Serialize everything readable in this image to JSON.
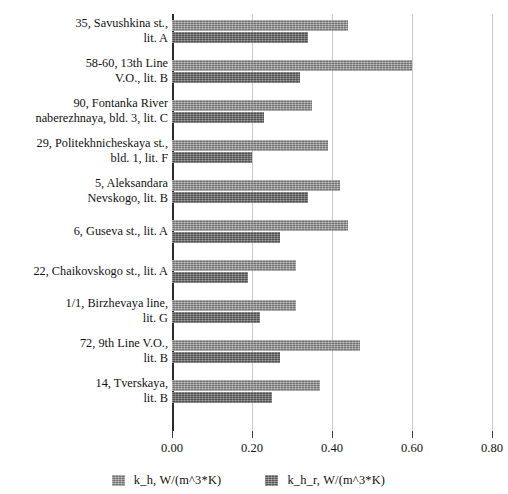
{
  "chart_data": {
    "type": "bar",
    "orientation": "horizontal",
    "title": "",
    "xlabel": "",
    "ylabel": "",
    "xlim": [
      0.0,
      0.8
    ],
    "grid": true,
    "legend_position": "bottom",
    "tick_labels": [
      "0.00",
      "0.20",
      "0.40",
      "0.60",
      "0.80"
    ],
    "tick_values": [
      0.0,
      0.2,
      0.4,
      0.6,
      0.8
    ],
    "categories": [
      "35, Savushkina st.,\nlit. A",
      "58-60, 13th Line\nV.O., lit. B",
      "90, Fontanka River\nnaberezhnaya, bld. 3, lit. C",
      "29, Politekhnicheskaya st.,\nbld. 1, lit. F",
      "5, Aleksandara\nNevskogo, lit. B",
      "6, Guseva st., lit. A",
      "22, Chaikovskogo st., lit. A",
      "1/1, Birzhevaya line,\nlit. G",
      "72, 9th Line V.O.,\nlit. B",
      "14, Tverskaya,\nlit. B"
    ],
    "series": [
      {
        "name": "k_h, W/(m^3*K)",
        "color": "#8f8f8f",
        "values": [
          0.44,
          0.6,
          0.35,
          0.39,
          0.42,
          0.44,
          0.31,
          0.31,
          0.47,
          0.37
        ]
      },
      {
        "name": "k_h_r, W/(m^3*K)",
        "color": "#6b6b6b",
        "values": [
          0.34,
          0.32,
          0.23,
          0.2,
          0.34,
          0.27,
          0.19,
          0.22,
          0.27,
          0.25
        ]
      }
    ]
  },
  "legend": {
    "entries": [
      {
        "label": "k_h, W/(m^3*K)",
        "swatch": "legend-swatch-light"
      },
      {
        "label": "k_h_r, W/(m^3*K)",
        "swatch": "legend-swatch-dark"
      }
    ]
  }
}
